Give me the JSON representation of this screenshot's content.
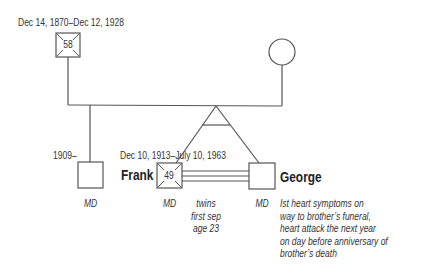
{
  "father": {
    "dates": "Dec 14, 1870–Dec 12, 1928",
    "age_at_death": "58",
    "deceased": true,
    "sex": "male"
  },
  "mother": {
    "sex": "female"
  },
  "older_son": {
    "dates": "1909–",
    "role": "MD",
    "sex": "male"
  },
  "frank": {
    "name": "Frank",
    "dates": "Dec 10, 1913–July 10, 1963",
    "age_at_death": "49",
    "role": "MD",
    "deceased": true,
    "sex": "male"
  },
  "george": {
    "name": "George",
    "role": "MD",
    "sex": "male",
    "note": [
      "Ist heart symptoms on",
      "way to brother’s funeral,",
      "heart attack the next year",
      "on day before anniversary of",
      "brother’s death"
    ]
  },
  "twins": {
    "relationship": "fused",
    "note": [
      "twins",
      "first sep",
      "age 23"
    ]
  },
  "colors": {
    "line": "#555555",
    "text": "#333333"
  }
}
